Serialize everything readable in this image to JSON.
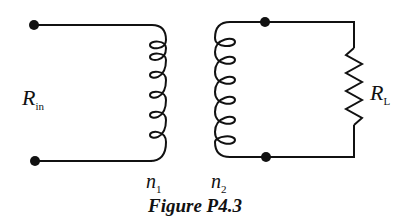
{
  "figure": {
    "caption": "Figure P4.3",
    "labels": {
      "r_in": {
        "main": "R",
        "sub": "in"
      },
      "r_l": {
        "main": "R",
        "sub": "L"
      },
      "n1": {
        "main": "n",
        "sub": "1"
      },
      "n2": {
        "main": "n",
        "sub": "2"
      }
    },
    "components": [
      "primary-terminals",
      "primary-coil",
      "secondary-coil",
      "secondary-terminals",
      "load-resistor"
    ]
  }
}
